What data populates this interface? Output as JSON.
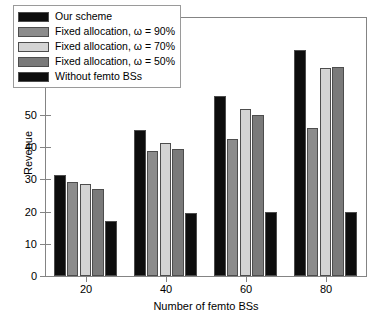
{
  "chart_data": {
    "type": "bar",
    "title": "",
    "xlabel": "Number of femto BSs",
    "ylabel": "Revenue",
    "categories": [
      "20",
      "40",
      "60",
      "80"
    ],
    "xlim": [
      10,
      90
    ],
    "ylim": [
      0,
      80
    ],
    "yticks": [
      "0",
      "10",
      "20",
      "30",
      "40",
      "50",
      "60",
      "70",
      "80"
    ],
    "xticks": [
      "20",
      "40",
      "60",
      "80"
    ],
    "grid": false,
    "legend_position": "upper left",
    "series": [
      {
        "name": "Our scheme",
        "color": "#0d0d0d",
        "values": [
          31.3,
          45.3,
          55.7,
          70.2
        ]
      },
      {
        "name": "Fixed allocation, ω = 90%",
        "color": "#8c8c8c",
        "values": [
          29.3,
          38.8,
          42.4,
          46.0
        ]
      },
      {
        "name": "Fixed allocation, ω = 70%",
        "color": "#d4d4d4",
        "values": [
          28.6,
          41.4,
          51.9,
          64.6
        ]
      },
      {
        "name": "Fixed allocation, ω = 50%",
        "color": "#7a7a7a",
        "values": [
          27.1,
          39.4,
          50.0,
          64.9
        ]
      },
      {
        "name": "Without femto BSs",
        "color": "#0d0d0d",
        "values": [
          17.0,
          19.5,
          19.7,
          20.0
        ]
      }
    ]
  },
  "legend": {
    "items": [
      {
        "label": "Our scheme",
        "swatch": "#0d0d0d"
      },
      {
        "label": "Fixed allocation, ω = 90%",
        "swatch": "#8c8c8c"
      },
      {
        "label": "Fixed allocation, ω = 70%",
        "swatch": "#d4d4d4"
      },
      {
        "label": "Fixed allocation, ω = 50%",
        "swatch": "#7a7a7a"
      },
      {
        "label": "Without femto BSs",
        "swatch": "#0d0d0d"
      }
    ]
  },
  "axes": {
    "x_title": "Number of femto BSs",
    "y_title": "Revenue"
  }
}
